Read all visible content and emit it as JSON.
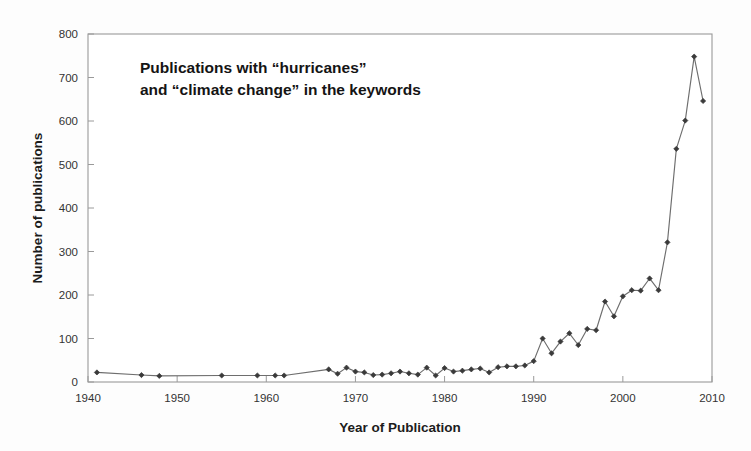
{
  "chart_data": {
    "type": "line",
    "title": "",
    "annotation": {
      "line1": "Publications with “hurricanes”",
      "line2": "and “climate change” in the keywords"
    },
    "xlabel": "Year of Publication",
    "ylabel": "Number of publications",
    "xlim": [
      1940,
      2010
    ],
    "ylim": [
      0,
      800
    ],
    "xticks": [
      1940,
      1950,
      1960,
      1970,
      1980,
      1990,
      2000,
      2010
    ],
    "xtick_labels": [
      "1940",
      "1950",
      "1960",
      "1970",
      "1980",
      "1990",
      "2000",
      "2010"
    ],
    "yticks": [
      0,
      100,
      200,
      300,
      400,
      500,
      600,
      700,
      800
    ],
    "ytick_labels": [
      "0",
      "100",
      "200",
      "300",
      "400",
      "500",
      "600",
      "700",
      "800"
    ],
    "grid": false,
    "legend": null,
    "marker": "diamond",
    "line_color": "#6e6e6e",
    "marker_color": "#3a3a3a",
    "series": [
      {
        "name": "Publications with \"hurricanes\" and \"climate change\" in the keywords",
        "x": [
          1941,
          1946,
          1948,
          1955,
          1959,
          1961,
          1962,
          1967,
          1968,
          1969,
          1970,
          1971,
          1972,
          1973,
          1974,
          1975,
          1976,
          1977,
          1978,
          1979,
          1980,
          1981,
          1982,
          1983,
          1984,
          1985,
          1986,
          1987,
          1988,
          1989,
          1990,
          1991,
          1992,
          1993,
          1994,
          1995,
          1996,
          1997,
          1998,
          1999,
          2000,
          2001,
          2002,
          2003,
          2004,
          2005,
          2006,
          2007,
          2008,
          2009
        ],
        "y": [
          22,
          16,
          14,
          15,
          15,
          15,
          15,
          29,
          19,
          33,
          24,
          22,
          16,
          17,
          20,
          24,
          20,
          17,
          33,
          15,
          32,
          24,
          26,
          29,
          31,
          22,
          34,
          36,
          36,
          38,
          48,
          100,
          66,
          93,
          112,
          85,
          122,
          119,
          185,
          151,
          197,
          211,
          210,
          238,
          211,
          321,
          536,
          601,
          748,
          646
        ]
      }
    ]
  }
}
